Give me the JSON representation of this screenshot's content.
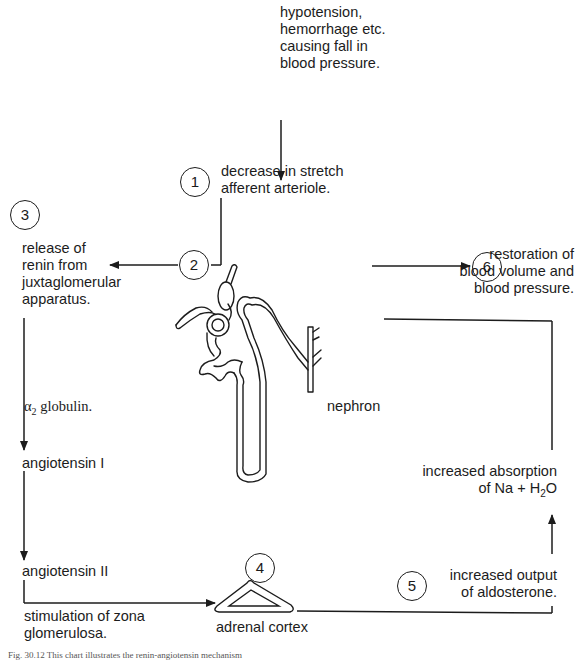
{
  "diagram": {
    "type": "flowchart",
    "steps": [
      {
        "id": "trigger",
        "text": "hypotension,\nhemorrhage etc.\ncausing  fall in\nblood pressure."
      },
      {
        "id": "1",
        "number": "1",
        "text": "decrease in stretch\nafferent arteriole."
      },
      {
        "id": "2",
        "number": "2"
      },
      {
        "id": "3",
        "number": "3",
        "text": "release of\nrenin from\njuxtaglomerular\napparatus."
      },
      {
        "id": "4",
        "number": "4",
        "text": "adrenal cortex"
      },
      {
        "id": "5",
        "number": "5",
        "text": "increased output\nof  aldosterone."
      },
      {
        "id": "6",
        "number": "6",
        "text": "restoration of\nblood volume and\nblood  pressure."
      }
    ],
    "labels": {
      "alpha_globulin_symbol": "α",
      "alpha_globulin_sub": "2",
      "alpha_globulin_text": " globulin.",
      "angiotensin_1": "angiotensin  I",
      "angiotensin_2": "angiotensin  II",
      "stimulation": "stimulation of zona\nglomerulosa.",
      "absorption": "increased absorption\nof   Na + H",
      "absorption_sub": "2",
      "absorption_end": "O",
      "nephron": "nephron"
    },
    "caption": "Fig. 30.12   This chart illustrates the renin-angiotensin mechanism"
  }
}
